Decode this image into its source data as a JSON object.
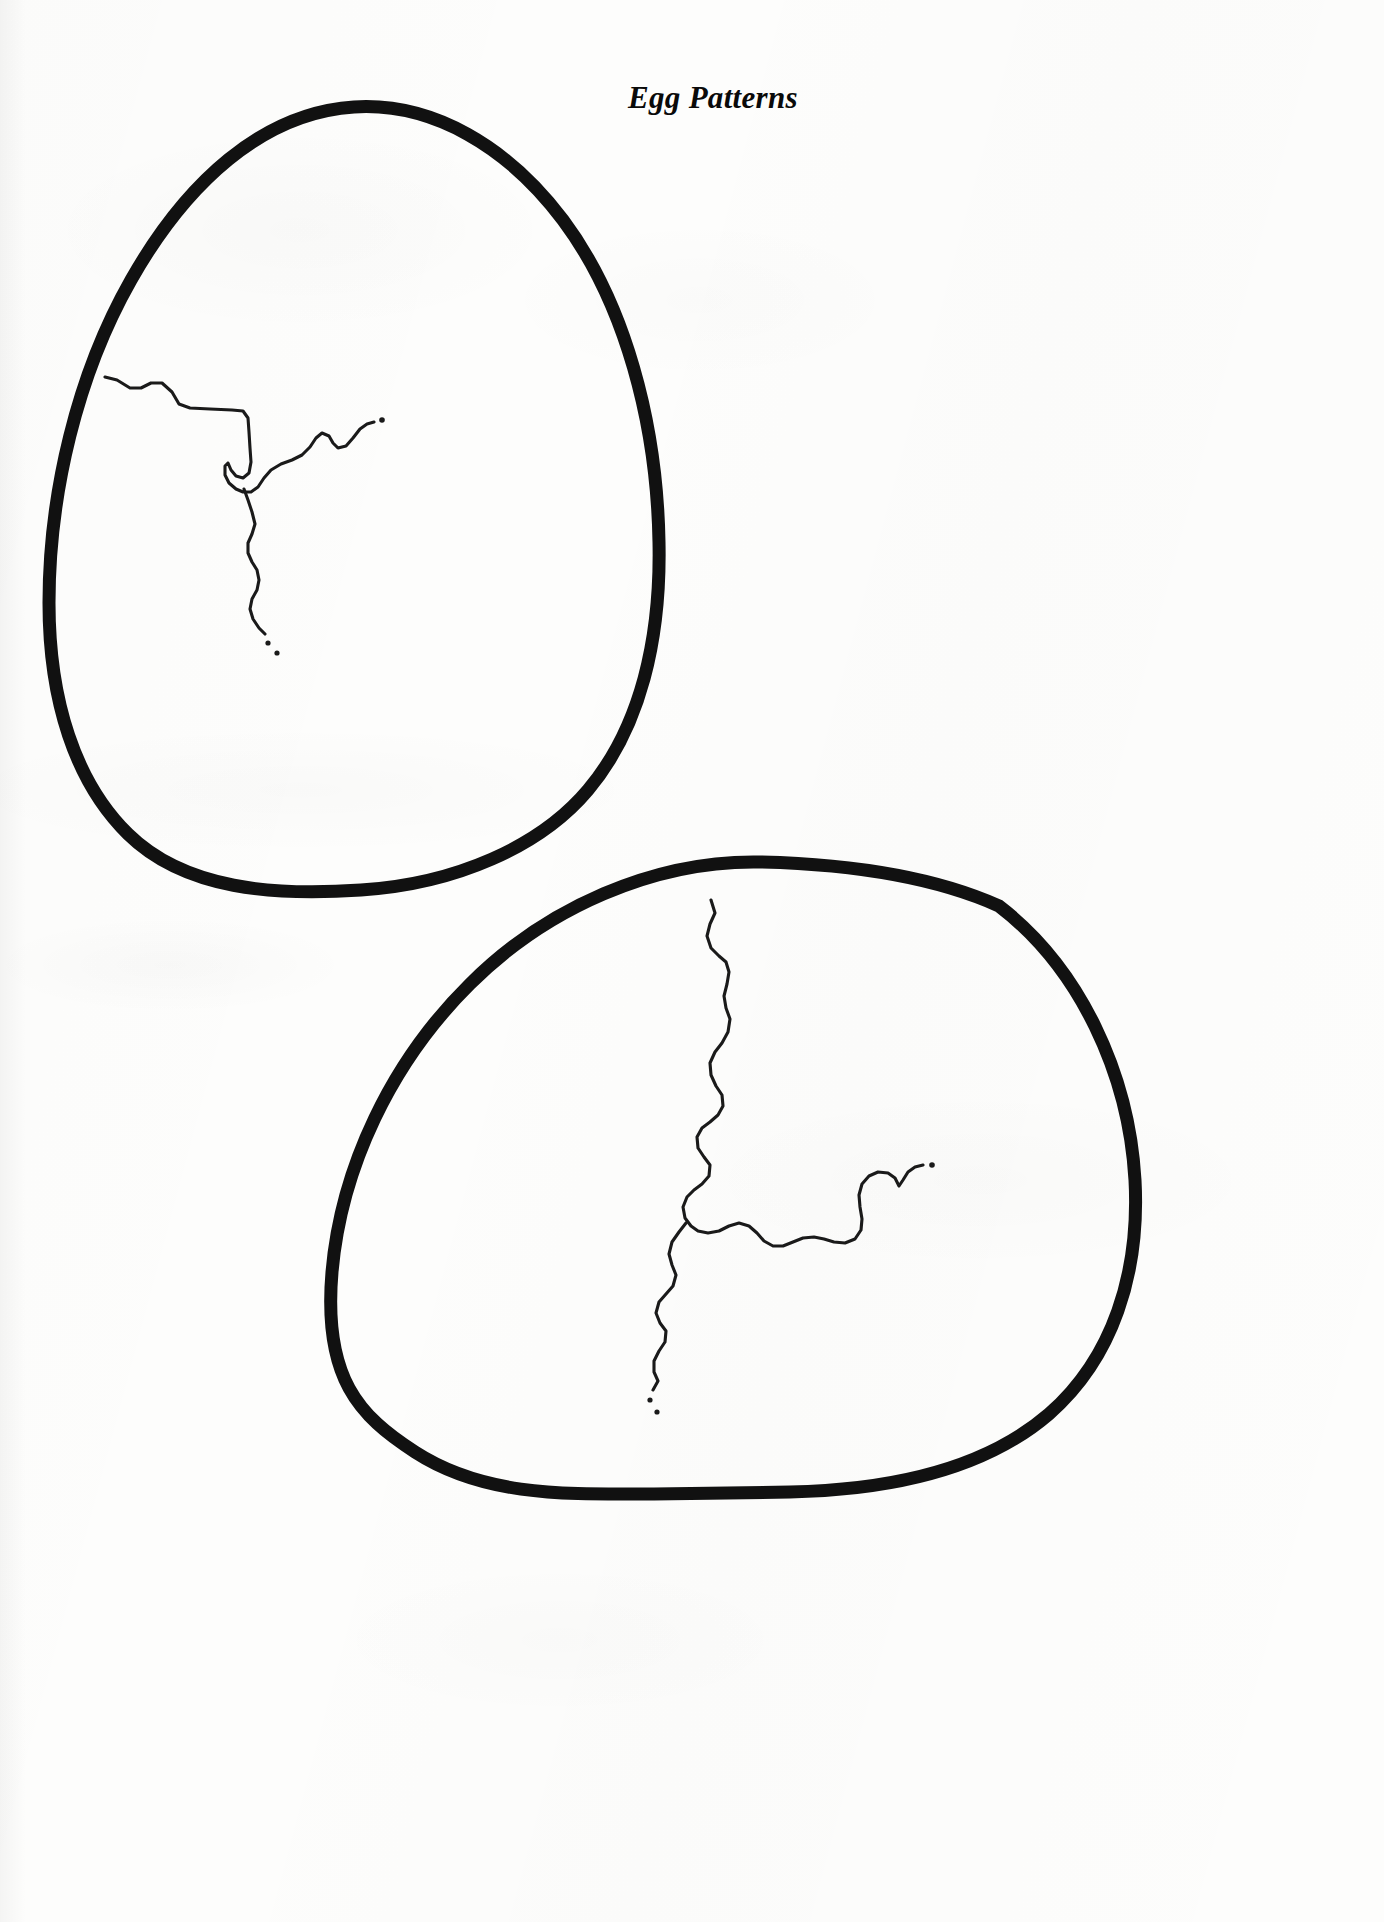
{
  "page": {
    "title": "Egg Patterns",
    "width": 1384,
    "height": 1922,
    "background_color": "#fdfdfc",
    "ink_color": "#111111",
    "document_type": "printable egg pattern template"
  },
  "figures": [
    {
      "id": "egg-1",
      "name": "Egg Pattern Top Left",
      "orientation": "upright",
      "outline_stroke_color": "#111111",
      "outline_stroke_width": 13,
      "crack_stroke_color": "#1a1a1a",
      "crack_stroke_width": 3.1,
      "crack_dot_count": 2
    },
    {
      "id": "egg-2",
      "name": "Egg Pattern Bottom Right",
      "orientation": "tilted",
      "outline_stroke_color": "#111111",
      "outline_stroke_width": 13,
      "crack_stroke_color": "#1a1a1a",
      "crack_stroke_width": 3.1,
      "crack_dot_count": 2
    }
  ],
  "geometry": {
    "egg1_outline": "M 354 107 C 262 113 186 183 131 280 C 77 375 49 494 49 603 C 49 700 75 782 128 834 C 185 890 275 896 361 890 C 455 884 540 847 588 790 C 641 727 661 638 659 542 C 657 423 625 303 563 220 C 508 147 433 102 354 107 Z",
    "egg1_crack": "M 105 377 L 117 380 L 130 388 L 141 388 L 151 383 L 162 383 L 172 392 L 179 404 L 190 408 L 210 409 L 232 410 L 243 411 L 248 418 L 249 432 L 250 448 L 251 462 L 249 473 L 243 478 L 236 476 L 231 470 L 228 463 L 225 466 L 225 475 L 229 483 L 236 489 L 243 492 L 251 492 L 258 487 L 264 478 L 271 470 L 281 464 L 292 460 L 302 455 L 310 447 L 316 438 L 322 433 L 329 436 L 333 443 L 338 448 L 346 446 L 353 438 L 360 429 L 367 424 L 374 422",
    "egg1_crack_branch": "M 244 489 L 248 500 L 252 512 L 255 524 L 252 534 L 248 543 L 248 553 L 252 562 L 257 570 L 259 580 L 257 590 L 252 599 L 250 609 L 253 619 L 259 628 L 265 634",
    "egg1_dots": [
      {
        "cx": 268,
        "cy": 643,
        "r": 2.6
      },
      {
        "cx": 277,
        "cy": 653,
        "r": 2.6
      }
    ],
    "egg1_crack_tip_dot": {
      "cx": 382,
      "cy": 420,
      "r": 2.8
    },
    "egg2_outline": "M 760 862 C 654 860 546 908 470 984 C 391 1062 341 1168 332 1272 C 323 1378 359 1416 415 1452 C 486 1498 571 1494 654 1494 L 790 1492 C 890 1490 984 1470 1049 1414 C 1113 1358 1140 1273 1135 1180 C 1129 1074 1080 968 999 906 C 930 875 845 864 760 862 Z",
    "egg2_crack": "M 711 900 L 715 913 L 710 924 L 707 936 L 711 948 L 719 956 L 726 962 L 729 972 L 727 984 L 724 996 L 726 1008 L 730 1019 L 728 1032 L 722 1043 L 715 1052 L 710 1063 L 711 1075 L 716 1086 L 722 1095 L 723 1106 L 718 1115 L 710 1122 L 702 1128 L 697 1137 L 698 1148 L 704 1157 L 710 1165 L 709 1176 L 702 1184 L 694 1190 L 687 1197 L 683 1207 L 685 1218 L 691 1226 L 698 1231 L 708 1233 L 719 1231 L 729 1226 L 739 1223 L 749 1226 L 757 1233 L 764 1241 L 773 1246 L 783 1246 L 793 1242 L 803 1238 L 814 1237 L 824 1239 L 834 1242 L 845 1243 L 855 1239 L 861 1230 L 862 1219 L 860 1207 L 859 1195 L 862 1184 L 869 1176 L 878 1172 L 888 1173 L 895 1178 L 899 1186 L 903 1180 L 908 1172 L 915 1167 L 923 1165",
    "egg2_crack_branch": "M 686 1223 L 679 1232 L 672 1242 L 669 1254 L 672 1265 L 676 1275 L 673 1286 L 666 1294 L 659 1302 L 656 1313 L 660 1323 L 666 1331 L 665 1342 L 659 1351 L 654 1361 L 654 1372 L 658 1381 L 653 1390",
    "egg2_dots": [
      {
        "cx": 650,
        "cy": 1400,
        "r": 2.6
      },
      {
        "cx": 657,
        "cy": 1412,
        "r": 2.6
      }
    ],
    "egg2_crack_tip_dot": {
      "cx": 932,
      "cy": 1165,
      "r": 2.8
    }
  }
}
